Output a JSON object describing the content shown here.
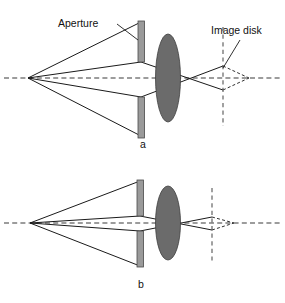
{
  "figure": {
    "background_color": "#ffffff",
    "width": 285,
    "height": 303
  },
  "labels": {
    "aperture": "Aperture",
    "image_disk": "Image disk",
    "panel_a": "a",
    "panel_b": "b"
  },
  "colors": {
    "aperture_fill": "#9a9a9a",
    "aperture_stroke": "#4a4a4a",
    "lens_fill": "#6b6b6b",
    "lens_stroke": "#3d3d3d",
    "ray_solid": "#1a1a1a",
    "ray_dashed": "#303030",
    "axis_dashed": "#3a3a3a",
    "plane_dashed": "#555555",
    "text": "#111111"
  },
  "panels": [
    {
      "id": "a",
      "letter": "a",
      "letter_position": {
        "x": 143,
        "y": 148
      },
      "optical_axis": {
        "y": 78,
        "x_start": 4,
        "x_end": 281,
        "style": "dashed"
      },
      "source_point": {
        "x": 28,
        "y": 78
      },
      "aperture": {
        "x": 138,
        "width": 6.5,
        "top_segment": {
          "y": 21,
          "height": 41
        },
        "bottom_segment": {
          "y": 97,
          "height": 41
        },
        "gap_top_y": 62,
        "gap_bottom_y": 97
      },
      "lens": {
        "cx": 168,
        "cy": 78,
        "rx": 12.5,
        "ry": 44
      },
      "image_plane": {
        "x": 223,
        "y_top": 27,
        "y_bottom": 126,
        "style": "dashed"
      },
      "focus_point": {
        "x": 249,
        "y": 78
      },
      "rays_solid": [
        {
          "from": {
            "x": 28,
            "y": 78
          },
          "to": {
            "x": 141,
            "y": 22
          },
          "note": "blocked-upper-edge"
        },
        {
          "from": {
            "x": 28,
            "y": 78
          },
          "to": {
            "x": 141,
            "y": 136
          },
          "note": "blocked-lower-edge"
        },
        {
          "from": {
            "x": 28,
            "y": 78
          },
          "via": {
            "x": 141,
            "y": 62
          },
          "to": {
            "x": 223,
            "y": 90
          },
          "note": "upper-aperture-edge-ray"
        },
        {
          "from": {
            "x": 28,
            "y": 78
          },
          "via": {
            "x": 141,
            "y": 97
          },
          "to": {
            "x": 223,
            "y": 66
          },
          "note": "lower-aperture-edge-ray"
        }
      ],
      "rays_dashed": [
        {
          "from": {
            "x": 223,
            "y": 66
          },
          "to": {
            "x": 249,
            "y": 78
          }
        },
        {
          "from": {
            "x": 223,
            "y": 90
          },
          "to": {
            "x": 249,
            "y": 78
          }
        }
      ],
      "image_disk_extent": {
        "x": 223,
        "y_top": 66,
        "y_bottom": 90
      }
    },
    {
      "id": "b",
      "letter": "b",
      "letter_position": {
        "x": 141,
        "y": 288
      },
      "optical_axis": {
        "y": 223,
        "x_start": 4,
        "x_end": 281,
        "style": "dashed"
      },
      "source_point": {
        "x": 30,
        "y": 223
      },
      "aperture": {
        "x": 137,
        "width": 6.5,
        "top_segment": {
          "y": 180,
          "height": 36
        },
        "bottom_segment": {
          "y": 231,
          "height": 36
        },
        "gap_top_y": 216,
        "gap_bottom_y": 231
      },
      "lens": {
        "cx": 168,
        "cy": 223,
        "rx": 12.5,
        "ry": 37
      },
      "image_plane": {
        "x": 212,
        "y_top": 188,
        "y_bottom": 263,
        "style": "dashed"
      },
      "focus_point": {
        "x": 234,
        "y": 223
      },
      "rays_solid": [
        {
          "from": {
            "x": 30,
            "y": 223
          },
          "to": {
            "x": 140,
            "y": 181
          },
          "note": "blocked-upper-edge"
        },
        {
          "from": {
            "x": 30,
            "y": 223
          },
          "to": {
            "x": 140,
            "y": 266
          },
          "note": "blocked-lower-edge"
        },
        {
          "from": {
            "x": 30,
            "y": 223
          },
          "via": {
            "x": 140,
            "y": 216
          },
          "to": {
            "x": 212,
            "y": 230
          },
          "note": "upper-aperture-edge-ray"
        },
        {
          "from": {
            "x": 30,
            "y": 223
          },
          "via": {
            "x": 140,
            "y": 231
          },
          "to": {
            "x": 212,
            "y": 217
          },
          "note": "lower-aperture-edge-ray"
        }
      ],
      "rays_dashed": [
        {
          "from": {
            "x": 212,
            "y": 217
          },
          "to": {
            "x": 234,
            "y": 223
          }
        },
        {
          "from": {
            "x": 212,
            "y": 230
          },
          "to": {
            "x": 234,
            "y": 223
          }
        }
      ],
      "image_disk_extent": {
        "x": 212,
        "y_top": 217,
        "y_bottom": 230
      }
    }
  ],
  "annotations": [
    {
      "name": "aperture-callout",
      "text": "Aperture",
      "text_position": {
        "x": 58,
        "y": 27
      },
      "leader": {
        "from": {
          "x": 117,
          "y": 24
        },
        "to": {
          "x": 138,
          "y": 40
        }
      }
    },
    {
      "name": "image-disk-callout",
      "text": "Image disk",
      "text_position": {
        "x": 212,
        "y": 35
      },
      "leader": {
        "from": {
          "x": 240,
          "y": 40
        },
        "to": {
          "x": 223,
          "y": 68
        }
      }
    }
  ]
}
